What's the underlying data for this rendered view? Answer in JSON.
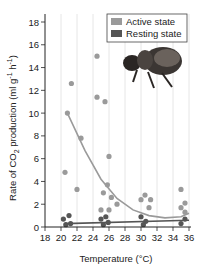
{
  "chart_data": {
    "type": "scatter",
    "title": "",
    "xlabel": "Temperature (°C)",
    "ylabel": "Rate of CO2 production (ml g-1 h-1)",
    "xlim": [
      18,
      36
    ],
    "ylim": [
      0,
      18
    ],
    "xticks": [
      18,
      20,
      22,
      24,
      26,
      28,
      30,
      32,
      34,
      36
    ],
    "yticks": [
      0,
      2,
      4,
      6,
      8,
      10,
      12,
      14,
      16,
      18
    ],
    "grid": "vertical lines",
    "legend_position": "top-right",
    "series": [
      {
        "name": "Active state",
        "color": "#9a9a9a",
        "points": [
          [
            20.5,
            4.8
          ],
          [
            20.8,
            10
          ],
          [
            21.3,
            12.6
          ],
          [
            22,
            3.3
          ],
          [
            22.5,
            7.8
          ],
          [
            24.5,
            15
          ],
          [
            24.5,
            11.4
          ],
          [
            25.5,
            11
          ],
          [
            25,
            1.5
          ],
          [
            25.3,
            3
          ],
          [
            25.8,
            3.7
          ],
          [
            26,
            6.2
          ],
          [
            26,
            1.5
          ],
          [
            26.3,
            2.6
          ],
          [
            27,
            2
          ],
          [
            30,
            2.4
          ],
          [
            30.5,
            2.8
          ],
          [
            31,
            1.7
          ],
          [
            31.2,
            2.4
          ],
          [
            35,
            3.3
          ],
          [
            35,
            1.7
          ],
          [
            35.5,
            2.1
          ],
          [
            35.5,
            1.3
          ]
        ],
        "trend": [
          [
            20.8,
            10
          ],
          [
            23,
            6.7
          ],
          [
            25,
            4.2
          ],
          [
            27,
            2.5
          ],
          [
            29,
            1.5
          ],
          [
            31,
            1.0
          ],
          [
            33,
            0.8
          ],
          [
            35,
            0.9
          ],
          [
            36,
            1.2
          ]
        ]
      },
      {
        "name": "Resting state",
        "color": "#555555",
        "points": [
          [
            20.3,
            0.7
          ],
          [
            20.6,
            0.2
          ],
          [
            21,
            1
          ],
          [
            21.2,
            0.3
          ],
          [
            25,
            0.7
          ],
          [
            25.3,
            0.2
          ],
          [
            25.6,
            0.9
          ],
          [
            25.9,
            0.4
          ],
          [
            30,
            0.9
          ],
          [
            30.3,
            0.2
          ],
          [
            30.6,
            0.5
          ],
          [
            35,
            0.3
          ],
          [
            35.5,
            0.7
          ]
        ],
        "trend": [
          [
            20.5,
            0.3
          ],
          [
            36,
            0.6
          ]
        ]
      }
    ]
  },
  "labels": {
    "xlabel": "Temperature (°C)",
    "ylabel_prefix": "Rate of CO",
    "ylabel_suffix": " production (ml g",
    "legend_active": "Active state",
    "legend_resting": "Resting state"
  }
}
